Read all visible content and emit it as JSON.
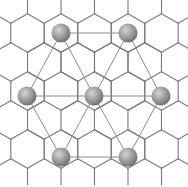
{
  "figure": {
    "colors": {
      "background": "#ffffff",
      "honeycomb_edges": "#7a7a7a",
      "superlattice_lines": "#8c8c8c",
      "atom_light": "#cfcfcf",
      "atom_mid": "#9a9a9a",
      "atom_dark": "#6e6e6e"
    },
    "honeycomb": {
      "hex_width": 33.5,
      "hex_side": 19.3,
      "row_spacing": 29,
      "origin_x": 61,
      "origin_y": 33
    },
    "atoms": [
      {
        "id": "top-left",
        "x": 61,
        "y": 33,
        "r": 9.5
      },
      {
        "id": "top-right",
        "x": 128,
        "y": 33,
        "r": 9.5
      },
      {
        "id": "middle-left",
        "x": 27,
        "y": 96,
        "r": 9.5
      },
      {
        "id": "center",
        "x": 94,
        "y": 96,
        "r": 9.5
      },
      {
        "id": "middle-right",
        "x": 161,
        "y": 96,
        "r": 9.5
      },
      {
        "id": "bottom-left",
        "x": 61,
        "y": 157,
        "r": 9.5
      },
      {
        "id": "bottom-right",
        "x": 128,
        "y": 157,
        "r": 9.5
      }
    ],
    "superlattice_bonds": [
      [
        "top-left",
        "top-right"
      ],
      [
        "middle-left",
        "center"
      ],
      [
        "center",
        "middle-right"
      ],
      [
        "bottom-left",
        "bottom-right"
      ],
      [
        "top-left",
        "middle-left"
      ],
      [
        "top-left",
        "center"
      ],
      [
        "top-right",
        "center"
      ],
      [
        "top-right",
        "middle-right"
      ],
      [
        "middle-left",
        "bottom-left"
      ],
      [
        "center",
        "bottom-left"
      ],
      [
        "center",
        "bottom-right"
      ],
      [
        "middle-right",
        "bottom-right"
      ]
    ]
  }
}
